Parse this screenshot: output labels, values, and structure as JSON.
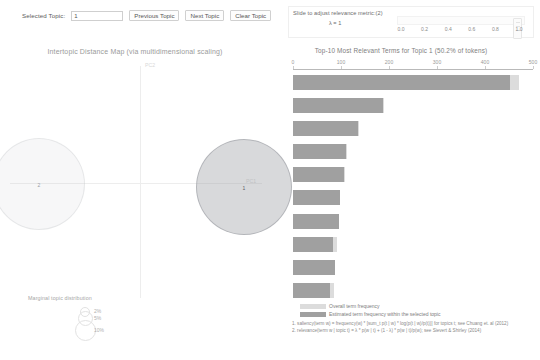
{
  "toolbar": {
    "selected_topic_label": "Selected Topic:",
    "topic_value": "1",
    "prev_label": "Previous Topic",
    "next_label": "Next Topic",
    "clear_label": "Clear Topic"
  },
  "left_panel": {
    "title": "Intertopic Distance Map (via multidimensional scaling)",
    "axis_x_label": "PC1",
    "axis_y_label": "PC2",
    "topics": [
      {
        "id": "1",
        "label": "1",
        "x": 243,
        "y": 186,
        "r": 47,
        "selected": true
      },
      {
        "id": "2",
        "label": "2",
        "x": 38,
        "y": 183,
        "r": 45,
        "selected": false
      }
    ],
    "legend": {
      "title": "Marginal topic distribution",
      "items": [
        {
          "value": "2%",
          "r": 4
        },
        {
          "value": "5%",
          "r": 6.5
        },
        {
          "value": "10%",
          "r": 9.5
        }
      ]
    }
  },
  "slider": {
    "label": "Slide to adjust relevance metric:(2)",
    "lambda_label": "λ = 1",
    "value": "1.0",
    "ticks": [
      "0.0",
      "0.2",
      "0.4",
      "0.6",
      "0.8",
      "1.0"
    ]
  },
  "barchart": {
    "title": "Top-10 Most Relevant Terms for Topic 1 (50.2% of tokens)",
    "legend": {
      "total_label": "Overall term frequency",
      "topic_label": "Estimated term frequency within the selected topic"
    },
    "footnotes": [
      "1. saliency(term w) = frequency(w) * [sum_t p(t | w) * log(p(t | w)/p(t))] for topics t; see Chuang et. al (2012)",
      "2. relevance(term w | topic t) = λ * p(w | t) + (1 - λ) * p(w | t)/p(w); see Sievert & Shirley (2014)"
    ]
  },
  "chart_data": {
    "type": "bar",
    "title": "Top-10 Most Relevant Terms for Topic 1 (50.2% of tokens)",
    "xlabel": "",
    "ylabel": "",
    "xlim": [
      0,
      500
    ],
    "xticks": [
      0,
      100,
      200,
      300,
      400,
      500
    ],
    "grid": false,
    "legend_position": "bottom",
    "orientation": "horizontal",
    "categories": [
      "study",
      "health",
      "people",
      "brain",
      "researcher",
      "women",
      "report",
      "obesity",
      "scientist",
      "team"
    ],
    "series": [
      {
        "name": "Overall term frequency",
        "values": [
          470,
          190,
          137,
          112,
          108,
          98,
          96,
          92,
          88,
          86
        ]
      },
      {
        "name": "Estimated term frequency within the selected topic",
        "values": [
          452,
          188,
          136,
          111,
          107,
          97,
          95,
          84,
          87,
          78
        ]
      }
    ]
  }
}
